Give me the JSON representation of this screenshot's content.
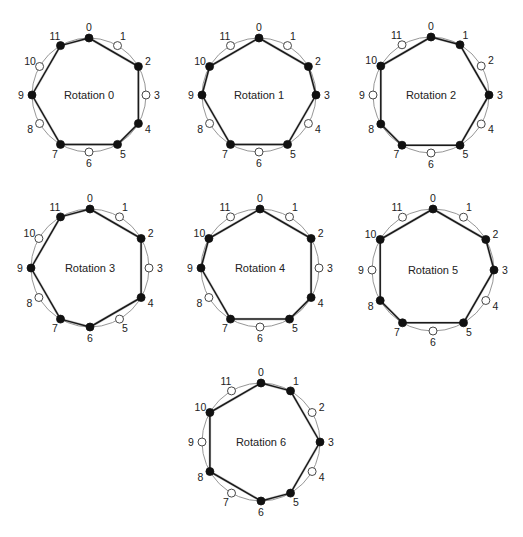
{
  "figure": {
    "pitch_classes": 12,
    "labels": [
      "0",
      "1",
      "2",
      "3",
      "4",
      "5",
      "6",
      "7",
      "8",
      "9",
      "10",
      "11"
    ],
    "colors": {
      "filled_node": "#111111",
      "open_node": "#ffffff",
      "circle": "#8a8a8a",
      "polygon": "#1a1a1a"
    },
    "panels": [
      {
        "title": "Rotation 0",
        "cx": 89,
        "cy": 95,
        "r": 57,
        "filled": [
          0,
          2,
          4,
          5,
          7,
          9,
          11
        ]
      },
      {
        "title": "Rotation 1",
        "cx": 259,
        "cy": 95,
        "r": 57,
        "filled": [
          0,
          2,
          3,
          5,
          7,
          9,
          10
        ]
      },
      {
        "title": "Rotation 2",
        "cx": 431,
        "cy": 95,
        "r": 58,
        "filled": [
          0,
          1,
          3,
          5,
          7,
          8,
          10
        ]
      },
      {
        "title": "Rotation 3",
        "cx": 90,
        "cy": 268,
        "r": 59,
        "filled": [
          0,
          2,
          4,
          6,
          7,
          9,
          11
        ]
      },
      {
        "title": "Rotation 4",
        "cx": 260,
        "cy": 268,
        "r": 59,
        "filled": [
          0,
          2,
          4,
          5,
          7,
          9,
          10
        ]
      },
      {
        "title": "Rotation 5",
        "cx": 433,
        "cy": 270,
        "r": 61,
        "filled": [
          0,
          2,
          3,
          5,
          7,
          8,
          10
        ]
      },
      {
        "title": "Rotation 6",
        "cx": 261,
        "cy": 442,
        "r": 59,
        "filled": [
          0,
          1,
          3,
          5,
          6,
          8,
          10
        ]
      }
    ]
  }
}
